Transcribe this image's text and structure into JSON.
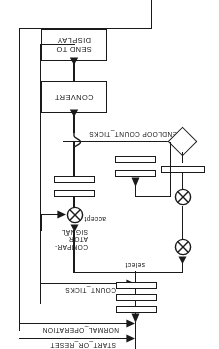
{
  "diagram": {
    "orientation": "rotated-180",
    "stroke_color": "#1a1a1a",
    "background_color": "#ffffff",
    "boxes": [
      {
        "id": "send_to_display",
        "label": "SEND TO\nDISPLAY"
      },
      {
        "id": "convert",
        "label": "CONVERT"
      }
    ],
    "flow_labels": [
      {
        "id": "endloop_count_ticks",
        "label": "ENDLOOP COUNT_TICKS"
      },
      {
        "id": "comparator_signal",
        "label": "COMPAR-\nATOR_\nSIGNAL"
      },
      {
        "id": "count_ticks",
        "label": "COUNT_TICKS"
      },
      {
        "id": "normal_operation",
        "label": "NORMAL_OPERATION"
      },
      {
        "id": "start_or_reset",
        "label": "START_OR_RESET"
      },
      {
        "id": "accept",
        "label": "accept"
      },
      {
        "id": "select",
        "label": "select"
      }
    ],
    "elements": {
      "decision_diamond": "decision-diamond",
      "gate_symbol": "crossed-circle-gate",
      "transition_bar": "transition-bar"
    }
  }
}
